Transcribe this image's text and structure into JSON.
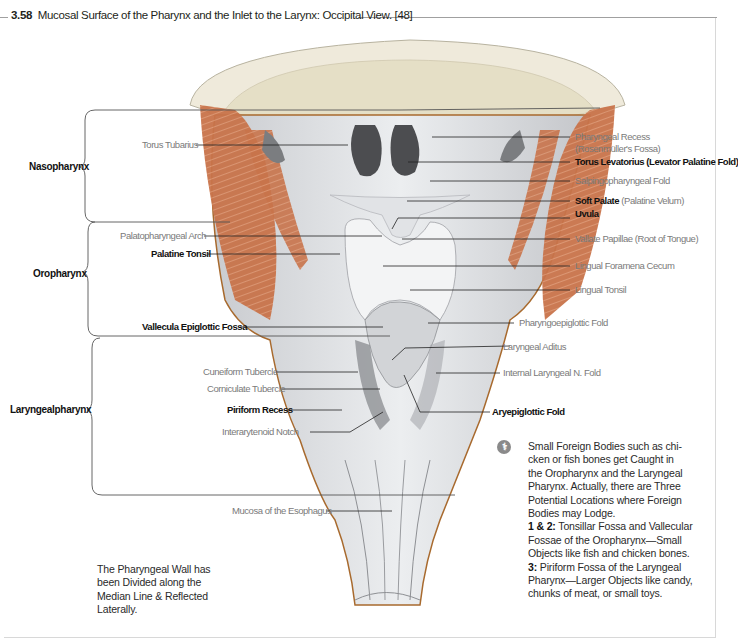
{
  "figure": {
    "number": "3.58",
    "title": "Mucosal Surface of the Pharynx and the Inlet to the Larynx: Occipital View. [48]"
  },
  "regions": [
    {
      "label": "Nasopharynx"
    },
    {
      "label": "Oropharynx"
    },
    {
      "label": "Laryngealpharynx"
    }
  ],
  "left_labels": [
    {
      "text": "Torus Tubarius",
      "style": "regular"
    },
    {
      "text": "Palatopharyngeal Arch",
      "style": "regular"
    },
    {
      "text": "Palatine Tonsil",
      "style": "bold"
    },
    {
      "text": "Vallecula Epiglottic Fossa",
      "style": "bold"
    },
    {
      "text": "Cuneiform Tubercle",
      "style": "regular"
    },
    {
      "text": "Corniculate Tubercle",
      "style": "regular"
    },
    {
      "text": "Piriform Recess",
      "style": "bold"
    },
    {
      "text": "Interarytenoid Notch",
      "style": "regular"
    },
    {
      "text": "Mucosa of the Esophagus",
      "style": "regular"
    }
  ],
  "right_labels": [
    {
      "text": "Pharyngeal Recess",
      "style": "regular"
    },
    {
      "text": "(Rosenmüller's Fossa)",
      "style": "regular"
    },
    {
      "text": "Torus Levatorius (Levator Palatine Fold)",
      "style": "bold"
    },
    {
      "text": "Salpingopharyngeal Fold",
      "style": "regular"
    },
    {
      "text": "Soft Palate",
      "style": "bold",
      "suffix": " (Palatine Velum)"
    },
    {
      "text": "Uvula",
      "style": "bold"
    },
    {
      "text": "Vallate Papillae (Root of Tongue)",
      "style": "regular"
    },
    {
      "text": "Lingual Foramena Cecum",
      "style": "regular"
    },
    {
      "text": "Lingual Tonsil",
      "style": "regular"
    },
    {
      "text": "Pharyngoepiglottic Fold",
      "style": "regular"
    },
    {
      "text": "Laryngeal Aditus",
      "style": "regular"
    },
    {
      "text": "Internal Laryngeal N. Fold",
      "style": "regular"
    },
    {
      "text": "Aryepiglottic Fold",
      "style": "bold"
    }
  ],
  "notes": {
    "bottom_left": [
      "The Pharyngeal Wall has",
      "been Divided along the",
      "Median Line & Reflected",
      "Laterally."
    ],
    "clinical": {
      "icon": "clinical-note-icon",
      "lines": [
        "Small Foreign Bodies such as chi-",
        "cken or fish bones get Caught in",
        "the Oropharynx and the Laryngeal",
        "Pharynx. Actually, there are Three",
        "Potential Locations where Foreign",
        "Bodies may Lodge."
      ],
      "item1_label": "1 & 2:",
      "item1_lines": [
        " Tonsillar Fossa and Vallecular",
        "Fossae of the Oropharynx—Small",
        "Objects like fish and chicken bones."
      ],
      "item2_label": "3:",
      "item2_lines": [
        " Piriform Fossa of the Laryngeal",
        "Pharynx—Larger Objects like candy,",
        "chunks of meat, or small toys."
      ]
    }
  },
  "colors": {
    "muscle": "#c8734a",
    "bone": "#e8e3cf",
    "mucosa": "#d9dbde",
    "mucosa_dark": "#9a9ca0",
    "outline": "#a86a2e",
    "leader": "#222222"
  }
}
